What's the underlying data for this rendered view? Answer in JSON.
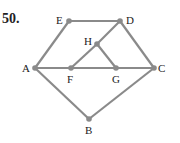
{
  "problem_number": "50.",
  "colors": {
    "edge": "#8a8a8a",
    "label": "#222222"
  },
  "nodes": [
    {
      "id": "E",
      "x": 69,
      "y": 21,
      "lx": 56,
      "ly": 24
    },
    {
      "id": "D",
      "x": 120,
      "y": 21,
      "lx": 126,
      "ly": 24
    },
    {
      "id": "H",
      "x": 97,
      "y": 44,
      "lx": 84,
      "ly": 45
    },
    {
      "id": "A",
      "x": 35,
      "y": 68,
      "lx": 22,
      "ly": 72
    },
    {
      "id": "F",
      "x": 71,
      "y": 68,
      "lx": 67,
      "ly": 83
    },
    {
      "id": "G",
      "x": 116,
      "y": 68,
      "lx": 112,
      "ly": 83
    },
    {
      "id": "C",
      "x": 154,
      "y": 68,
      "lx": 158,
      "ly": 72
    },
    {
      "id": "B",
      "x": 89,
      "y": 119,
      "lx": 85,
      "ly": 134
    }
  ],
  "edges": [
    [
      "E",
      "D"
    ],
    [
      "A",
      "E"
    ],
    [
      "D",
      "C"
    ],
    [
      "D",
      "H"
    ],
    [
      "H",
      "F"
    ],
    [
      "H",
      "G"
    ],
    [
      "A",
      "F"
    ],
    [
      "F",
      "G"
    ],
    [
      "G",
      "C"
    ],
    [
      "A",
      "B"
    ],
    [
      "B",
      "C"
    ]
  ]
}
